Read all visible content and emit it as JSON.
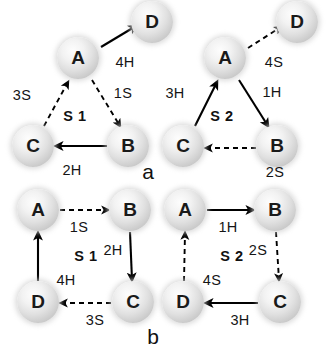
{
  "figure": {
    "panels": [
      {
        "panel_label": "a",
        "panel_label_pos": [
          148,
          172
        ],
        "subpanels": [
          {
            "state_label": "S 1",
            "state_label_pos": [
              75,
              116
            ],
            "nodes": [
              {
                "id": "A",
                "label": "A",
                "x": 78,
                "y": 58
              },
              {
                "id": "B",
                "label": "B",
                "x": 128,
                "y": 146
              },
              {
                "id": "C",
                "label": "C",
                "x": 33,
                "y": 146
              },
              {
                "id": "D",
                "label": "D",
                "x": 152,
                "y": 22
              }
            ],
            "edges": [
              {
                "from": "A",
                "to": "D",
                "label": "4H",
                "label_pos": [
                  125,
                  62
                ],
                "style": "solid"
              },
              {
                "from": "A",
                "to": "B",
                "label": "1S",
                "label_pos": [
                  123,
                  93
                ],
                "style": "dashed"
              },
              {
                "from": "B",
                "to": "C",
                "label": "2H",
                "label_pos": [
                  72,
                  170
                ],
                "style": "solid"
              },
              {
                "from": "C",
                "to": "A",
                "label": "3S",
                "label_pos": [
                  22,
                  95
                ],
                "style": "dashed"
              }
            ]
          },
          {
            "state_label": "S 2",
            "state_label_pos": [
              222,
              116
            ],
            "nodes": [
              {
                "id": "A",
                "label": "A",
                "x": 225,
                "y": 58
              },
              {
                "id": "B",
                "label": "B",
                "x": 277,
                "y": 146
              },
              {
                "id": "C",
                "label": "C",
                "x": 183,
                "y": 146
              },
              {
                "id": "D",
                "label": "D",
                "x": 297,
                "y": 22
              }
            ],
            "edges": [
              {
                "from": "A",
                "to": "D",
                "label": "4S",
                "label_pos": [
                  274,
                  62
                ],
                "style": "dashed"
              },
              {
                "from": "A",
                "to": "B",
                "label": "1H",
                "label_pos": [
                  272,
                  92
                ],
                "style": "solid"
              },
              {
                "from": "B",
                "to": "C",
                "label": "2S",
                "label_pos": [
                  275,
                  172
                ],
                "style": "dashed"
              },
              {
                "from": "C",
                "to": "A",
                "label": "3H",
                "label_pos": [
                  175,
                  93
                ],
                "style": "solid"
              }
            ]
          }
        ]
      },
      {
        "panel_label": "b",
        "panel_label_pos": [
          153,
          337
        ],
        "subpanels": [
          {
            "state_label": "S 1",
            "state_label_pos": [
              86,
              256
            ],
            "nodes": [
              {
                "id": "A",
                "label": "A",
                "x": 38,
                "y": 210
              },
              {
                "id": "B",
                "label": "B",
                "x": 130,
                "y": 210
              },
              {
                "id": "C",
                "label": "C",
                "x": 133,
                "y": 302
              },
              {
                "id": "D",
                "label": "D",
                "x": 38,
                "y": 302
              }
            ],
            "edges": [
              {
                "from": "A",
                "to": "B",
                "label": "1S",
                "label_pos": [
                  79,
                  227
                ],
                "style": "dashed"
              },
              {
                "from": "B",
                "to": "C",
                "label": "2H",
                "label_pos": [
                  113,
                  250
                ],
                "style": "solid"
              },
              {
                "from": "C",
                "to": "D",
                "label": "3S",
                "label_pos": [
                  95,
                  320
                ],
                "style": "dashed"
              },
              {
                "from": "D",
                "to": "A",
                "label": "4H",
                "label_pos": [
                  66,
                  280
                ],
                "style": "solid"
              }
            ]
          },
          {
            "state_label": "S 2",
            "state_label_pos": [
              232,
              256
            ],
            "nodes": [
              {
                "id": "A",
                "label": "A",
                "x": 185,
                "y": 210
              },
              {
                "id": "B",
                "label": "B",
                "x": 275,
                "y": 210
              },
              {
                "id": "C",
                "label": "C",
                "x": 280,
                "y": 302
              },
              {
                "id": "D",
                "label": "D",
                "x": 183,
                "y": 302
              }
            ],
            "edges": [
              {
                "from": "A",
                "to": "B",
                "label": "1H",
                "label_pos": [
                  228,
                  227
                ],
                "style": "solid"
              },
              {
                "from": "B",
                "to": "C",
                "label": "2S",
                "label_pos": [
                  258,
                  250
                ],
                "style": "dashed"
              },
              {
                "from": "C",
                "to": "D",
                "label": "3H",
                "label_pos": [
                  240,
                  320
                ],
                "style": "solid"
              },
              {
                "from": "D",
                "to": "A",
                "label": "4S",
                "label_pos": [
                  212,
                  280
                ],
                "style": "dashed"
              }
            ]
          }
        ]
      }
    ],
    "colors": {
      "background": "#ffffff",
      "node_fill": "#e2e2e2",
      "text": "#111111",
      "arrow": "#000000"
    },
    "arrow_segments": [
      {
        "name": "a-s1-A-D",
        "x1": 101,
        "y1": 47,
        "x2": 136,
        "y2": 26,
        "style": "solid"
      },
      {
        "name": "a-s1-A-B",
        "x1": 92,
        "y1": 80,
        "x2": 120,
        "y2": 126,
        "style": "dashed"
      },
      {
        "name": "a-s1-B-C",
        "x1": 107,
        "y1": 146,
        "x2": 56,
        "y2": 146,
        "style": "solid"
      },
      {
        "name": "a-s1-C-A",
        "x1": 44,
        "y1": 126,
        "x2": 68,
        "y2": 82,
        "style": "dashed"
      },
      {
        "name": "a-s2-A-D",
        "x1": 248,
        "y1": 48,
        "x2": 281,
        "y2": 27,
        "style": "dashed"
      },
      {
        "name": "a-s2-A-B",
        "x1": 239,
        "y1": 80,
        "x2": 268,
        "y2": 126,
        "style": "solid"
      },
      {
        "name": "a-s2-B-C",
        "x1": 256,
        "y1": 148,
        "x2": 206,
        "y2": 148,
        "style": "dashed"
      },
      {
        "name": "a-s2-C-A",
        "x1": 195,
        "y1": 126,
        "x2": 217,
        "y2": 82,
        "style": "solid"
      },
      {
        "name": "b-s1-A-B",
        "x1": 60,
        "y1": 210,
        "x2": 108,
        "y2": 210,
        "style": "dashed"
      },
      {
        "name": "b-s1-B-C",
        "x1": 130,
        "y1": 232,
        "x2": 132,
        "y2": 280,
        "style": "solid"
      },
      {
        "name": "b-s1-C-D",
        "x1": 111,
        "y1": 303,
        "x2": 61,
        "y2": 303,
        "style": "dashed"
      },
      {
        "name": "b-s1-D-A",
        "x1": 38,
        "y1": 281,
        "x2": 38,
        "y2": 233,
        "style": "solid"
      },
      {
        "name": "b-s2-A-B",
        "x1": 207,
        "y1": 210,
        "x2": 253,
        "y2": 210,
        "style": "solid"
      },
      {
        "name": "b-s2-B-C",
        "x1": 276,
        "y1": 232,
        "x2": 279,
        "y2": 280,
        "style": "dashed"
      },
      {
        "name": "b-s2-C-D",
        "x1": 258,
        "y1": 303,
        "x2": 206,
        "y2": 303,
        "style": "solid"
      },
      {
        "name": "b-s2-D-A",
        "x1": 184,
        "y1": 281,
        "x2": 185,
        "y2": 233,
        "style": "dashed"
      }
    ]
  }
}
